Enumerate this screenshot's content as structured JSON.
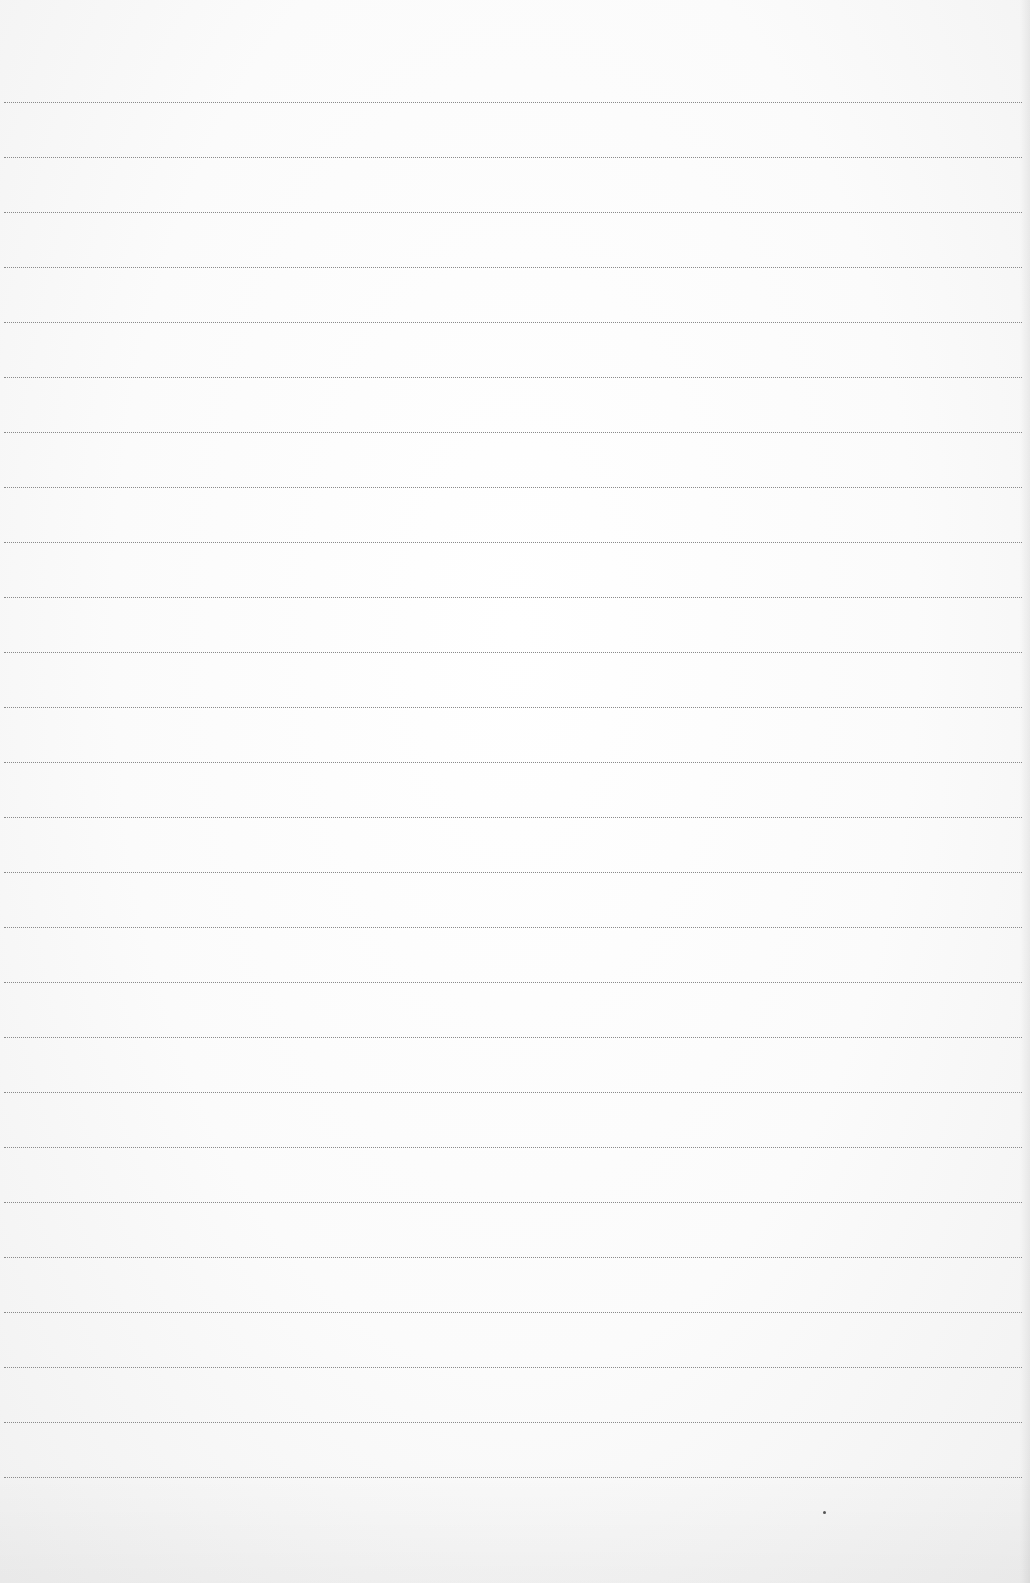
{
  "sheet": {
    "type": "lined-paper",
    "background_color": "#fafafa",
    "line_color": "#8a8a8a",
    "line_count": 26,
    "first_line_y": 102,
    "line_spacing": 55,
    "line_left": 4,
    "line_right": 1022,
    "text_content": ""
  },
  "marks": [
    {
      "kind": "speck",
      "x": 824,
      "y": 1512
    }
  ]
}
